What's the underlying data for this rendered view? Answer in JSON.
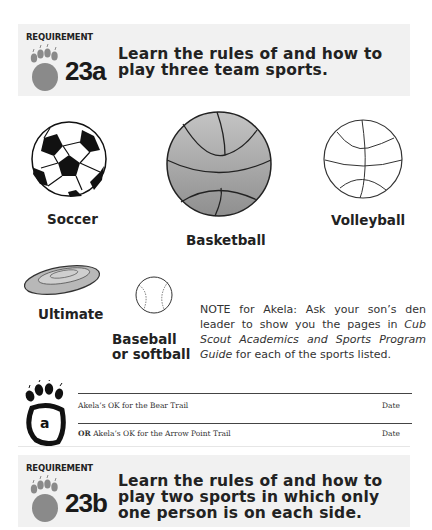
{
  "requirement_a": {
    "label": "REQUIREMENT",
    "number": "23a",
    "text": "Learn the rules of and how to play three team sports."
  },
  "sports": [
    {
      "name": "Soccer",
      "icon": "soccer-ball-icon"
    },
    {
      "name": "Basketball",
      "icon": "basketball-icon"
    },
    {
      "name": "Volleyball",
      "icon": "volleyball-icon"
    },
    {
      "name": "Ultimate",
      "icon": "flying-disc-icon"
    },
    {
      "name": "Baseball or softball",
      "icon": "baseball-icon"
    }
  ],
  "note": {
    "prefix": "NOTE for Akela: Ask your son’s den leader to show you the pages in ",
    "title": "Cub Scout Academics and Sports Program Guide",
    "suffix": " for each of the sports listed."
  },
  "signoff": {
    "paw_letter": "a",
    "bear_trail": "Akela’s OK  for the Bear Trail",
    "arrow_or": "OR",
    "arrow_trail": " Akela’s OK  for the Arrow Point Trail",
    "date_label": "Date"
  },
  "requirement_b": {
    "label": "REQUIREMENT",
    "number": "23b",
    "text": "Learn the rules of and how to play two sports in which only one person is on each side."
  },
  "colors": {
    "req_background": "#f1f1f1",
    "paw_gray": "#8a8a8a",
    "basketball_gray": "#a8a8a8"
  }
}
